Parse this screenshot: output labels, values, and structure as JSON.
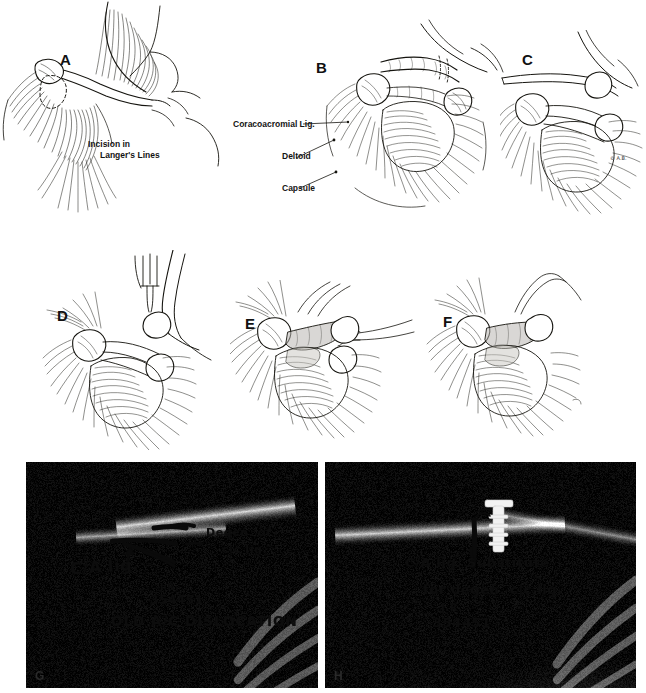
{
  "figure": {
    "background_color": "#ffffff",
    "ink_color": "#111111",
    "panel_count": 8
  },
  "drawings": {
    "panels": [
      {
        "letter": "A",
        "caption": "Skin incision and exposure over the acromioclavicular joint"
      },
      {
        "letter": "B",
        "caption": "Deltoid reflected exposing coracoacromial ligament and capsule"
      },
      {
        "letter": "C",
        "caption": "Coracoacromial ligament released from the acromion"
      },
      {
        "letter": "D",
        "caption": "Distal clavicle resected and held with a retractor"
      },
      {
        "letter": "E",
        "caption": "Coracoacromial ligament transferred and sutured"
      },
      {
        "letter": "F",
        "caption": "Completed transfer of the coracoacromial ligament"
      }
    ],
    "labels": [
      {
        "id": "incision",
        "text_line1": "Incision in",
        "text_line2": "Langer's  Lines"
      },
      {
        "id": "coracoacromial",
        "text": "Coracoacromial Lig."
      },
      {
        "id": "deltoid",
        "text": "Deltoid"
      },
      {
        "id": "capsule",
        "text": "Capsule"
      }
    ],
    "artist_signature": "© A.B."
  },
  "radiographs": [
    {
      "letter": "G",
      "annotations": [
        {
          "id": "ca-lig",
          "text": "C/A lig."
        },
        {
          "id": "degen-1",
          "text": "Degen. of"
        },
        {
          "id": "degen-2",
          "text": "c|c lig."
        },
        {
          "id": "initials",
          "text": "J.R."
        },
        {
          "id": "case-number",
          "text": "354451"
        },
        {
          "id": "diagnosis",
          "text": "OLD A/C DISLOCATION"
        }
      ]
    },
    {
      "letter": "H",
      "annotations": [
        {
          "id": "substitute-1",
          "text": "C/A lig. Substitute"
        },
        {
          "id": "substitute-2",
          "text": "for degen. c|c lig."
        },
        {
          "id": "initials",
          "text": "J.R."
        },
        {
          "id": "case-number",
          "text": "354451"
        }
      ]
    }
  ]
}
